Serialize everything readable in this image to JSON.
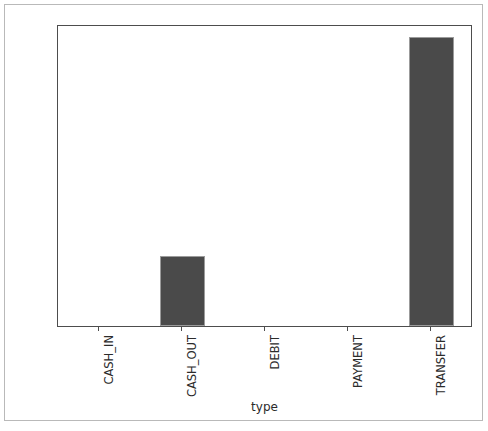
{
  "chart_data": {
    "type": "bar",
    "title": "",
    "subtitle": "",
    "xlabel": "type",
    "ylabel": "",
    "categories": [
      "CASH_IN",
      "CASH_OUT",
      "DEBIT",
      "PAYMENT",
      "TRANSFER"
    ],
    "values": [
      0.0,
      0.00185,
      0.0,
      0.0,
      0.00765
    ],
    "series": [
      {
        "name": "fraud rate by type",
        "values": [
          0.0,
          0.00185,
          0.0,
          0.0,
          0.00765
        ]
      }
    ],
    "ylim": [
      0.0,
      0.008
    ],
    "yticks": [
      0.0,
      0.001,
      0.002,
      0.003,
      0.004,
      0.005,
      0.006,
      0.007,
      0.008
    ],
    "ytick_labels": [
      "0.000",
      "0.001",
      "0.002",
      "0.003",
      "0.004",
      "0.005",
      "0.006",
      "0.007",
      "0.008"
    ],
    "xtick_labels": [
      "CASH_IN",
      "CASH_OUT",
      "DEBIT",
      "PAYMENT",
      "TRANSFER"
    ],
    "xtick_rotation": 90,
    "grid": false,
    "legend": false,
    "legend_position": "none",
    "bar_color": "#4a4a4a",
    "bar_edge_color": "#9b9b9b",
    "background_color": "#ffffff",
    "axis_color": "#4d4d4d",
    "frame_color": "#b9b9b9",
    "annotations": []
  }
}
